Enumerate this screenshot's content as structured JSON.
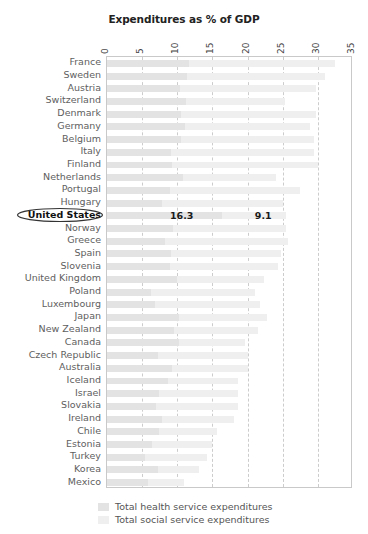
{
  "chart_data": {
    "type": "bar",
    "orientation": "horizontal",
    "stacked": true,
    "title": "Expenditures as % of GDP",
    "xlabel": "",
    "ylabel": "",
    "xlim": [
      0,
      35
    ],
    "xticks": [
      0,
      5,
      10,
      15,
      20,
      25,
      30,
      35
    ],
    "xtick_labels": [
      "0",
      "5",
      "10",
      "15",
      "20",
      "25",
      "30",
      "35"
    ],
    "grid": true,
    "legend_position": "bottom",
    "categories": [
      "France",
      "Sweden",
      "Austria",
      "Switzerland",
      "Denmark",
      "Germany",
      "Belgium",
      "Italy",
      "Finland",
      "Netherlands",
      "Portugal",
      "Hungary",
      "United States",
      "Norway",
      "Greece",
      "Spain",
      "Slovenia",
      "United Kingdom",
      "Poland",
      "Luxembourg",
      "Japan",
      "New Zealand",
      "Canada",
      "Czech Republic",
      "Australia",
      "Iceland",
      "Israel",
      "Slovakia",
      "Ireland",
      "Chile",
      "Estonia",
      "Turkey",
      "Korea",
      "Mexico"
    ],
    "series": [
      {
        "name": "Total health service expenditures",
        "color": "#e3e3e3",
        "values": [
          11.6,
          11.4,
          10.4,
          11.2,
          10.5,
          11.1,
          10.5,
          9.1,
          9.3,
          10.8,
          9.0,
          7.8,
          16.3,
          9.4,
          8.3,
          9.1,
          8.9,
          9.9,
          6.3,
          6.9,
          10.2,
          9.5,
          10.3,
          7.3,
          9.3,
          8.7,
          7.4,
          7.0,
          7.8,
          7.4,
          6.4,
          5.4,
          7.2,
          5.9
        ]
      },
      {
        "name": "Total social service expenditures",
        "color": "#efefef",
        "values": [
          20.8,
          19.6,
          19.4,
          14.1,
          19.3,
          17.8,
          19.0,
          20.3,
          20.7,
          13.3,
          18.4,
          17.2,
          9.1,
          16.1,
          17.5,
          15.6,
          15.4,
          12.5,
          14.7,
          14.9,
          12.5,
          12.0,
          9.4,
          12.8,
          10.8,
          10.0,
          11.3,
          11.6,
          10.2,
          8.2,
          8.5,
          8.8,
          5.9,
          5.0
        ]
      }
    ],
    "highlighted_category": "United States",
    "highlight_annotations": [
      {
        "label": "16.3",
        "series": "Total health service expenditures"
      },
      {
        "label": "9.1",
        "series": "Total social service expenditures"
      }
    ]
  },
  "legend": {
    "items": [
      {
        "label": "Total health service expenditures",
        "color": "#e3e3e3"
      },
      {
        "label": "Total social service expenditures",
        "color": "#efefef"
      }
    ]
  }
}
